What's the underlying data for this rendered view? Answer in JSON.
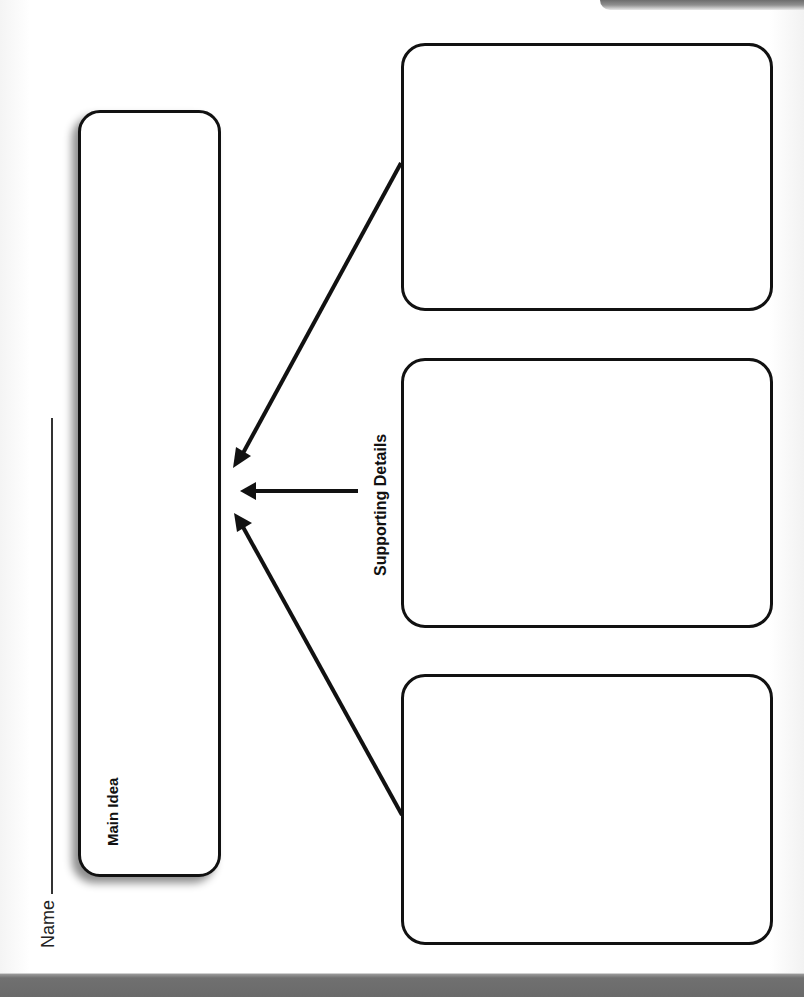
{
  "worksheet": {
    "name_label": "Name",
    "main_idea": {
      "label": "Main Idea"
    },
    "supporting_details": {
      "label": "Supporting Details",
      "boxes": [
        {
          "position": "top",
          "content": ""
        },
        {
          "position": "middle",
          "content": ""
        },
        {
          "position": "bottom",
          "content": ""
        }
      ]
    },
    "arrows": [
      {
        "from": "top-detail-box",
        "to": "main-idea-box",
        "direction": "diagonal"
      },
      {
        "from": "supporting-details-label",
        "to": "main-idea-box",
        "direction": "horizontal"
      },
      {
        "from": "bottom-detail-box",
        "to": "main-idea-box",
        "direction": "diagonal"
      }
    ]
  },
  "colors": {
    "ink": "#111111",
    "paper": "#ffffff",
    "band": "#6a6a6a"
  }
}
